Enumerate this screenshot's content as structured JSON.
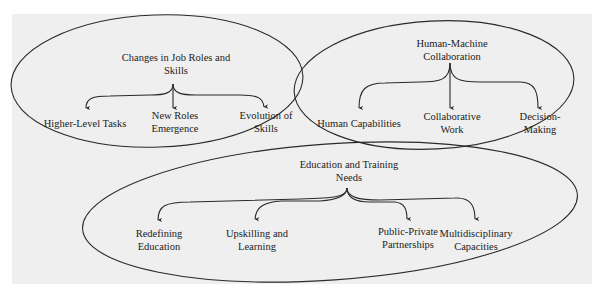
{
  "diagram": {
    "groups": [
      {
        "id": "job-roles",
        "title_line1": "Changes in Job Roles and",
        "title_line2": "Skills",
        "children": [
          {
            "line1": "Higher-Level Tasks",
            "line2": ""
          },
          {
            "line1": "New Roles",
            "line2": "Emergence"
          },
          {
            "line1": "Evolution of",
            "line2": "Skills"
          }
        ]
      },
      {
        "id": "human-machine",
        "title_line1": "Human-Machine",
        "title_line2": "Collaboration",
        "children": [
          {
            "line1": "Human Capabilities",
            "line2": ""
          },
          {
            "line1": "Collaborative",
            "line2": "Work"
          },
          {
            "line1": "Decision-",
            "line2": "Making"
          }
        ]
      },
      {
        "id": "education",
        "title_line1": "Education and Training",
        "title_line2": "Needs",
        "children": [
          {
            "line1": "Redefining",
            "line2": "Education"
          },
          {
            "line1": "Upskilling and",
            "line2": "Learning"
          },
          {
            "line1": "Public-Private",
            "line2": "Partnerships"
          },
          {
            "line1": "Multidisciplinary",
            "line2": "Capacities"
          }
        ]
      }
    ],
    "colors": {
      "stroke": "#2a2a2a",
      "text": "#222222",
      "page_background": "#efefef"
    }
  }
}
